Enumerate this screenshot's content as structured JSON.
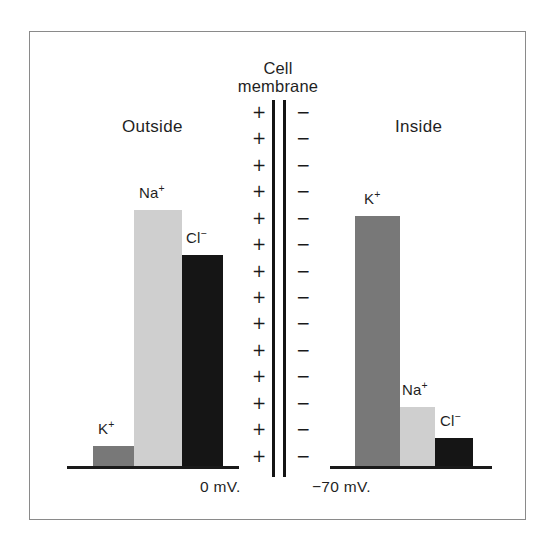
{
  "figure": {
    "background_color": "#ffffff",
    "frame_color": "#8a8a8a",
    "axis_color": "#1a1a1a"
  },
  "labels": {
    "outside": "Outside",
    "inside": "Inside",
    "membrane_line1": "Cell",
    "membrane_line2": "membrane",
    "voltage_outside": "0 mV.",
    "voltage_inside": "−70 mV."
  },
  "membrane": {
    "positive_symbol": "+",
    "negative_symbol": "−",
    "charge_pair_count": 14,
    "positive_side": "outside",
    "negative_side": "inside"
  },
  "colors": {
    "potassium": "#787878",
    "sodium": "#cfcfcf",
    "chloride": "#151515"
  },
  "chart_data": {
    "type": "bar",
    "title": "",
    "subtitle": "",
    "xlabel": "",
    "ylabel": "Relative ion concentration",
    "grid": false,
    "legend": "none",
    "ylim": [
      0,
      100
    ],
    "annotations": [
      "Cell membrane",
      "Outside",
      "Inside",
      "0 mV.",
      "−70 mV."
    ],
    "panels": [
      {
        "name": "Outside",
        "membrane_charge": "+",
        "membrane_potential": "0 mV.",
        "categories": [
          "K⁺",
          "Na⁺",
          "Cl⁻"
        ],
        "values": [
          8,
          100,
          82
        ],
        "bar_colors": [
          "#787878",
          "#cfcfcf",
          "#151515"
        ],
        "bars": [
          {
            "ion": "K",
            "charge": "+",
            "label_text": "K",
            "label_sup": "+",
            "value": 8,
            "color": "#787878"
          },
          {
            "ion": "Na",
            "charge": "+",
            "label_text": "Na",
            "label_sup": "+",
            "value": 100,
            "color": "#cfcfcf"
          },
          {
            "ion": "Cl",
            "charge": "−",
            "label_text": "Cl",
            "label_sup": "−",
            "value": 82,
            "color": "#151515"
          }
        ]
      },
      {
        "name": "Inside",
        "membrane_charge": "−",
        "membrane_potential": "−70 mV.",
        "categories": [
          "K⁺",
          "Na⁺",
          "Cl⁻"
        ],
        "values": [
          97,
          23,
          11
        ],
        "bar_colors": [
          "#787878",
          "#cfcfcf",
          "#151515"
        ],
        "bars": [
          {
            "ion": "K",
            "charge": "+",
            "label_text": "K",
            "label_sup": "+",
            "value": 97,
            "color": "#787878"
          },
          {
            "ion": "Na",
            "charge": "+",
            "label_text": "Na",
            "label_sup": "+",
            "value": 23,
            "color": "#cfcfcf"
          },
          {
            "ion": "Cl",
            "charge": "−",
            "label_text": "Cl",
            "label_sup": "−",
            "value": 11,
            "color": "#151515"
          }
        ]
      }
    ]
  }
}
